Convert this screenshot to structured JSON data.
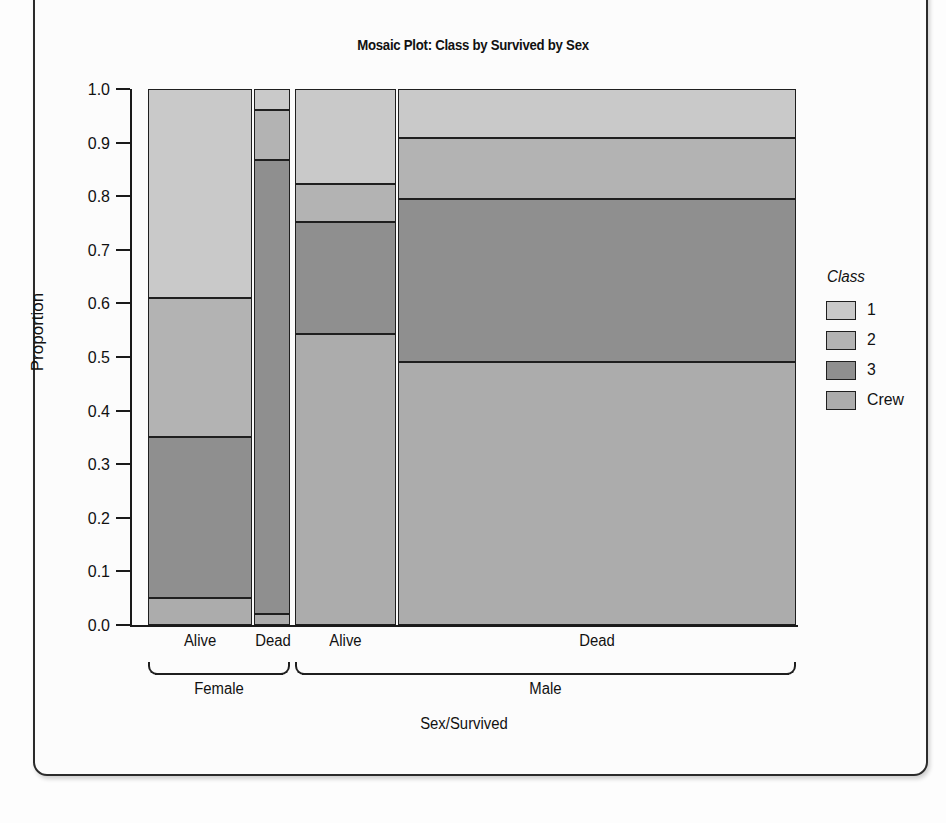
{
  "figure": {
    "top_artifact": "",
    "title": "Mosaic Plot: Class by Survived by Sex"
  },
  "axes": {
    "ylabel": "Proportion",
    "xlabel": "Sex/Survived",
    "yticks": [
      "1.0",
      "0.9",
      "0.8",
      "0.7",
      "0.6",
      "0.5",
      "0.4",
      "0.3",
      "0.2",
      "0.1",
      "0.0"
    ],
    "xticks": [
      "Alive",
      "Dead",
      "Alive",
      "Dead"
    ],
    "groups": [
      "Female",
      "Male"
    ]
  },
  "legend": {
    "title": "Class",
    "items": [
      {
        "label": "1",
        "color": "#c9c9c9"
      },
      {
        "label": "2",
        "color": "#b3b3b3"
      },
      {
        "label": "3",
        "color": "#8f8f8f"
      },
      {
        "label": "Crew",
        "color": "#acacac"
      }
    ]
  },
  "chart_data": {
    "type": "mosaic",
    "title": "Mosaic Plot: Class by Survived by Sex",
    "xlabel": "Sex/Survived",
    "ylabel": "Proportion",
    "ylim": [
      0.0,
      1.0
    ],
    "grid": false,
    "legend_position": "right",
    "legend_title": "Class",
    "classes": [
      "1",
      "2",
      "3",
      "Crew"
    ],
    "class_colors": [
      "#c9c9c9",
      "#b3b3b3",
      "#8f8f8f",
      "#acacac"
    ],
    "columns": [
      {
        "group": "Female",
        "survived": "Alive",
        "width_fraction": 0.162,
        "proportions": {
          "1": 0.39,
          "2": 0.26,
          "3": 0.3,
          "Crew": 0.05
        },
        "boundaries": [
          1.0,
          0.61,
          0.35,
          0.05,
          0.0
        ]
      },
      {
        "group": "Female",
        "survived": "Dead",
        "width_fraction": 0.056,
        "proportions": {
          "1": 0.04,
          "2": 0.093,
          "3": 0.847,
          "Crew": 0.02
        },
        "boundaries": [
          1.0,
          0.96,
          0.867,
          0.02,
          0.0
        ]
      },
      {
        "group": "Male",
        "survived": "Alive",
        "width_fraction": 0.157,
        "proportions": {
          "1": 0.177,
          "2": 0.071,
          "3": 0.21,
          "Crew": 0.542
        },
        "boundaries": [
          1.0,
          0.823,
          0.752,
          0.542,
          0.0
        ]
      },
      {
        "group": "Male",
        "survived": "Dead",
        "width_fraction": 0.619,
        "proportions": {
          "1": 0.091,
          "2": 0.114,
          "3": 0.305,
          "Crew": 0.49
        },
        "boundaries": [
          1.0,
          0.909,
          0.795,
          0.49,
          0.0
        ]
      }
    ]
  }
}
